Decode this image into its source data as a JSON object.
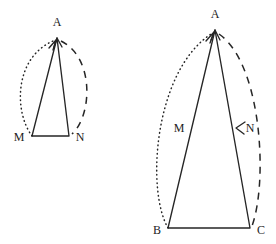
{
  "figure": {
    "background_color": "#ffffff",
    "stroke_color": "#262626",
    "label_color": "#1c1c1c",
    "width": 276,
    "height": 244
  },
  "left_figure": {
    "name": "small-triangle-AMN",
    "vertices": [
      {
        "label": "A",
        "x": 57,
        "y": 38,
        "label_x": 57,
        "label_y": 26
      },
      {
        "label": "M",
        "x": 32,
        "y": 136,
        "label_x": 19,
        "label_y": 141
      },
      {
        "label": "N",
        "x": 69,
        "y": 136,
        "label_x": 80,
        "label_y": 141
      }
    ],
    "edges": "M 57 38 L 32 136 L 69 136 L 57 38 Z",
    "dotted_arc": {
      "name": "arc-M-to-A",
      "path": "M 32 136 C 14 112 14 58 53 41",
      "style": "dotted",
      "arrow_at": "A"
    },
    "dashed_arc": {
      "name": "arc-A-to-N",
      "path": "M 61 41 C 95 58 92 116 72 134",
      "style": "dashed",
      "arrow_at": "none"
    }
  },
  "right_figure": {
    "name": "large-triangle-ABC",
    "vertices": [
      {
        "label": "A",
        "x": 215,
        "y": 30,
        "label_x": 215,
        "label_y": 18
      },
      {
        "label": "B",
        "x": 168,
        "y": 228,
        "label_x": 157,
        "label_y": 234
      },
      {
        "label": "C",
        "x": 250,
        "y": 228,
        "label_x": 261,
        "label_y": 234
      },
      {
        "label": "M",
        "x": 192,
        "y": 128,
        "label_x": 179,
        "label_y": 132
      },
      {
        "label": "N",
        "x": 238,
        "y": 128,
        "label_x": 248,
        "label_y": 132
      }
    ],
    "edges": "M 215 30 L 168 228 L 250 228 L 215 30 Z",
    "dotted_arc": {
      "name": "arc-B-to-A",
      "path": "M 168 228 C 146 190 154 72 211 34",
      "style": "dotted",
      "arrow_at": "A"
    },
    "dashed_arc": {
      "name": "arc-A-to-C",
      "path": "M 219 34 C 262 64 268 182 252 226",
      "style": "dashed",
      "arrow_at": "N"
    }
  }
}
